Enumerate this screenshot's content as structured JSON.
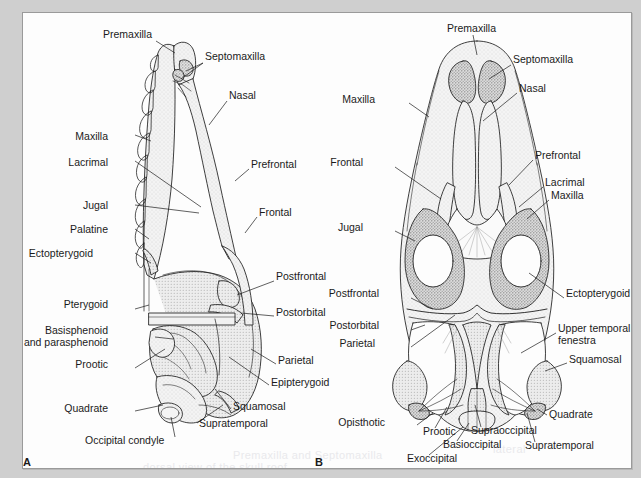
{
  "figure": {
    "background_color": "#cfcfcf",
    "sheet_color": "#fdfdfd",
    "ink_color": "#1b1b1b"
  },
  "panels": [
    {
      "id": "A",
      "letter": "A",
      "view": "dorsal skull, left half lateral/dorsal composite",
      "labels": [
        {
          "text": "Premaxilla",
          "x": 80,
          "y": 22,
          "align": "left"
        },
        {
          "text": "Septomaxilla",
          "x": 182,
          "y": 44,
          "align": "left"
        },
        {
          "text": "Nasal",
          "x": 206,
          "y": 83,
          "align": "left"
        },
        {
          "text": "Maxilla",
          "x": 85,
          "y": 124,
          "align": "right"
        },
        {
          "text": "Lacrimal",
          "x": 80,
          "y": 150,
          "align": "right"
        },
        {
          "text": "Prefrontal",
          "x": 228,
          "y": 152,
          "align": "left"
        },
        {
          "text": "Jugal",
          "x": 80,
          "y": 193,
          "align": "right"
        },
        {
          "text": "Frontal",
          "x": 236,
          "y": 200,
          "align": "left"
        },
        {
          "text": "Palatine",
          "x": 80,
          "y": 217,
          "align": "right"
        },
        {
          "text": "Ectopterygoid",
          "x": 46,
          "y": 241,
          "align": "right"
        },
        {
          "text": "Postfrontal",
          "x": 253,
          "y": 264,
          "align": "left"
        },
        {
          "text": "Pterygoid",
          "x": 68,
          "y": 292,
          "align": "right"
        },
        {
          "text": "Postorbital",
          "x": 253,
          "y": 300,
          "align": "left"
        },
        {
          "text": "Basisphenoid",
          "x": 56,
          "y": 318,
          "align": "right"
        },
        {
          "text": "and parasphenoid",
          "x": 56,
          "y": 330,
          "align": "right"
        },
        {
          "text": "Parietal",
          "x": 255,
          "y": 348,
          "align": "left"
        },
        {
          "text": "Prootic",
          "x": 88,
          "y": 352,
          "align": "right"
        },
        {
          "text": "Epipterygoid",
          "x": 248,
          "y": 370,
          "align": "left"
        },
        {
          "text": "Squamosal",
          "x": 210,
          "y": 394,
          "align": "left"
        },
        {
          "text": "Quadrate",
          "x": 76,
          "y": 396,
          "align": "right"
        },
        {
          "text": "Supratemporal",
          "x": 176,
          "y": 411,
          "align": "left"
        },
        {
          "text": "Occipital condyle",
          "x": 96,
          "y": 428,
          "align": "right"
        }
      ]
    },
    {
      "id": "B",
      "letter": "B",
      "view": "dorsal skull roof",
      "labels": [
        {
          "text": "Premaxilla",
          "x": 124,
          "y": 16,
          "align": "left"
        },
        {
          "text": "Septomaxilla",
          "x": 190,
          "y": 47,
          "align": "left"
        },
        {
          "text": "Nasal",
          "x": 196,
          "y": 76,
          "align": "left"
        },
        {
          "text": "Maxilla",
          "x": 52,
          "y": 87,
          "align": "right"
        },
        {
          "text": "Frontal",
          "x": 40,
          "y": 150,
          "align": "right"
        },
        {
          "text": "Prefrontal",
          "x": 212,
          "y": 143,
          "align": "left"
        },
        {
          "text": "Lacrimal",
          "x": 222,
          "y": 170,
          "align": "left"
        },
        {
          "text": "Maxilla",
          "x": 228,
          "y": 183,
          "align": "left"
        },
        {
          "text": "Jugal",
          "x": 40,
          "y": 215,
          "align": "right"
        },
        {
          "text": "Ectopterygoid",
          "x": 243,
          "y": 281,
          "align": "left"
        },
        {
          "text": "Postfrontal",
          "x": 56,
          "y": 281,
          "align": "right"
        },
        {
          "text": "Upper temporal",
          "x": 235,
          "y": 316,
          "align": "left"
        },
        {
          "text": "fenestra",
          "x": 235,
          "y": 328,
          "align": "left"
        },
        {
          "text": "Postorbital",
          "x": 56,
          "y": 313,
          "align": "right"
        },
        {
          "text": "Parietal",
          "x": 52,
          "y": 331,
          "align": "right"
        },
        {
          "text": "Squamosal",
          "x": 246,
          "y": 347,
          "align": "left"
        },
        {
          "text": "Quadrate",
          "x": 226,
          "y": 400,
          "align": "left"
        },
        {
          "text": "Opisthotic",
          "x": 62,
          "y": 409,
          "align": "right"
        },
        {
          "text": "Prootic",
          "x": 100,
          "y": 419,
          "align": "left"
        },
        {
          "text": "Supraoccipital",
          "x": 148,
          "y": 418,
          "align": "left"
        },
        {
          "text": "Basioccipital",
          "x": 120,
          "y": 432,
          "align": "left"
        },
        {
          "text": "Supratemporal",
          "x": 202,
          "y": 433,
          "align": "left"
        },
        {
          "text": "Exocciptal_placeholder",
          "x": 0,
          "y": 0,
          "align": "left"
        },
        {
          "text": "Exoccipital",
          "x": 84,
          "y": 446,
          "align": "left"
        }
      ]
    }
  ],
  "bone_names": [
    "Premaxilla",
    "Septomaxilla",
    "Nasal",
    "Maxilla",
    "Lacrimal",
    "Prefrontal",
    "Jugal",
    "Frontal",
    "Palatine",
    "Ectopterygoid",
    "Postfrontal",
    "Pterygoid",
    "Postorbital",
    "Basisphenoid and parasphenoid",
    "Parietal",
    "Prootic",
    "Epipterygoid",
    "Squamosal",
    "Quadrate",
    "Supratemporal",
    "Occipital condyle",
    "Upper temporal fenestra",
    "Opisthotic",
    "Supraoccipital",
    "Basioccipital",
    "Exoccipital"
  ],
  "ghost_text": [
    {
      "text": "Premaxilla and Septomaxilla",
      "x": 210,
      "y": 436
    },
    {
      "text": "dorsal view of the skull roof",
      "x": 120,
      "y": 452
    },
    {
      "text": "lateral",
      "x": 470,
      "y": 438
    }
  ]
}
